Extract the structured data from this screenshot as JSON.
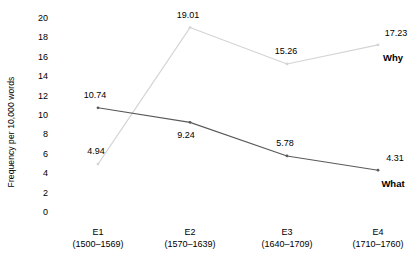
{
  "chart_data": {
    "type": "line",
    "title": "",
    "xlabel": "",
    "ylabel": "Frequency per 10,000 words",
    "categories": [
      "E1",
      "E2",
      "E3",
      "E4"
    ],
    "category_ranges": [
      "(1500–1569)",
      "(1570–1639)",
      "(1640–1709)",
      "(1710–1760)"
    ],
    "ylim": [
      0,
      20
    ],
    "yticks": [
      "20",
      "18",
      "16",
      "14",
      "12",
      "10",
      "8",
      "6",
      "4",
      "2",
      "0"
    ],
    "ytick_values": [
      20,
      18,
      16,
      14,
      12,
      10,
      8,
      6,
      4,
      2,
      0
    ],
    "grid": false,
    "legend": "end-of-line labels",
    "series": [
      {
        "name": "Why",
        "color": "#d4d4d4",
        "values": [
          4.94,
          19.01,
          15.26,
          17.23
        ],
        "labels": [
          "4.94",
          "19.01",
          "15.26",
          "17.23"
        ]
      },
      {
        "name": "What",
        "color": "#5a5a5a",
        "values": [
          10.74,
          9.24,
          5.78,
          4.31
        ],
        "labels": [
          "10.74",
          "9.24",
          "5.78",
          "4.31"
        ]
      }
    ]
  },
  "axis": {
    "y_title": "Frequency per 10,000 words"
  },
  "y_ticks": [
    {
      "label": "20"
    },
    {
      "label": "18"
    },
    {
      "label": "16"
    },
    {
      "label": "14"
    },
    {
      "label": "12"
    },
    {
      "label": "10"
    },
    {
      "label": "8"
    },
    {
      "label": "6"
    },
    {
      "label": "4"
    },
    {
      "label": "2"
    },
    {
      "label": "0"
    }
  ],
  "x_ticks": [
    {
      "period": "E1",
      "range": "(1500–1569)"
    },
    {
      "period": "E2",
      "range": "(1570–1639)"
    },
    {
      "period": "E3",
      "range": "(1640–1709)"
    },
    {
      "period": "E4",
      "range": "(1710–1760)"
    }
  ],
  "value_labels": {
    "why": [
      "4.94",
      "19.01",
      "15.26",
      "17.23"
    ],
    "what": [
      "10.74",
      "9.24",
      "5.78",
      "4.31"
    ]
  },
  "series_labels": {
    "why": "Why",
    "what": "What"
  }
}
